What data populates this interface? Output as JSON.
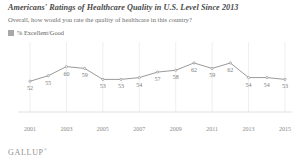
{
  "header": {
    "title": "Americans' Ratings of Healthcare Quality in U.S. Level Since 2013",
    "subtitle": "Overall, how would you rate the quality of healthcare in this country?"
  },
  "legend": {
    "label": "% Excellent/Good",
    "swatch_color": "#a8a8a8"
  },
  "footer": {
    "logo": "GALLUP",
    "logo_mark": "®"
  },
  "chart_data": {
    "type": "line",
    "title": "Americans' Ratings of Healthcare Quality in U.S. Level Since 2013",
    "subtitle": "Overall, how would you rate the quality of healthcare in this country?",
    "xlabel": "",
    "ylabel": "",
    "grid": true,
    "legend_position": "top-left",
    "line_color": "#9a9a9a",
    "marker_color": "#9a9a9a",
    "label_color": "#7a7a7a",
    "ylim": [
      45,
      68
    ],
    "x": [
      2001,
      2002,
      2003,
      2004,
      2005,
      2006,
      2007,
      2008,
      2009,
      2010,
      2011,
      2012,
      2013,
      2014,
      2015
    ],
    "tick_labels": [
      "2001",
      "2003",
      "2005",
      "2007",
      "2009",
      "2011",
      "2013",
      "2015"
    ],
    "tick_values": [
      2001,
      2003,
      2005,
      2007,
      2009,
      2011,
      2013,
      2015
    ],
    "series": [
      {
        "name": "% Excellent/Good",
        "values": [
          52,
          55,
          60,
          59,
          53,
          53,
          54,
          57,
          58,
          62,
          59,
          62,
          54,
          54,
          53
        ]
      }
    ]
  }
}
